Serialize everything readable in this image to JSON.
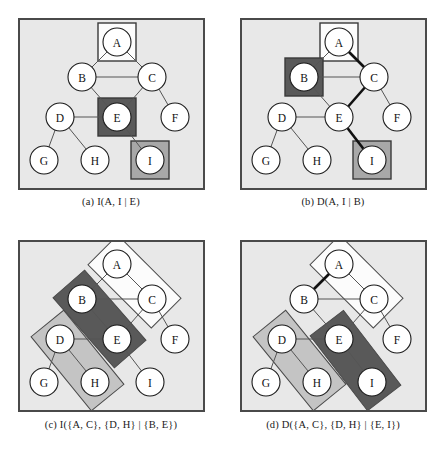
{
  "figure": {
    "kind": "graph-separation-diagram",
    "background": "#ffffff",
    "panel_fill": "#e8e8e8",
    "panel_border": "#4a4a4a",
    "node_fill": "#ffffff",
    "node_stroke": "#1a1a1a",
    "edge_color": "#555555",
    "bold_edge_color": "#111111",
    "shade_dark": "#595959",
    "shade_mid": "#a8a8a8",
    "shade_light": "#c4c4c4",
    "shade_white": "#fcfcfc"
  },
  "graph": {
    "nodes": [
      {
        "id": "A",
        "label": "A",
        "x": 97,
        "y": 22
      },
      {
        "id": "B",
        "label": "B",
        "x": 62,
        "y": 57
      },
      {
        "id": "C",
        "label": "C",
        "x": 132,
        "y": 57
      },
      {
        "id": "D",
        "label": "D",
        "x": 40,
        "y": 97
      },
      {
        "id": "E",
        "label": "E",
        "x": 97,
        "y": 97
      },
      {
        "id": "F",
        "label": "F",
        "x": 155,
        "y": 97
      },
      {
        "id": "G",
        "label": "G",
        "x": 24,
        "y": 140
      },
      {
        "id": "H",
        "label": "H",
        "x": 75,
        "y": 140
      },
      {
        "id": "I",
        "label": "I",
        "x": 130,
        "y": 140
      }
    ],
    "edges": [
      [
        "A",
        "B"
      ],
      [
        "A",
        "C"
      ],
      [
        "B",
        "C"
      ],
      [
        "B",
        "E"
      ],
      [
        "C",
        "E"
      ],
      [
        "C",
        "F"
      ],
      [
        "D",
        "E"
      ],
      [
        "D",
        "G"
      ],
      [
        "D",
        "H"
      ],
      [
        "E",
        "I"
      ]
    ],
    "node_radius": 14
  },
  "panels": [
    {
      "key": "a",
      "caption_prefix": "(a)",
      "caption_expr": "I(A, I | E)",
      "caption_full": "(a) I(A, I | E)",
      "relation": "I",
      "highlight_boxes": [
        {
          "node": "A",
          "shade": "white"
        },
        {
          "node": "E",
          "shade": "dark"
        },
        {
          "node": "I",
          "shade": "mid"
        }
      ],
      "bold_path": [],
      "group_rects": []
    },
    {
      "key": "b",
      "caption_prefix": "(b)",
      "caption_expr": "D(A, I | B)",
      "caption_full": "(b) D(A, I | B)",
      "relation": "D",
      "highlight_boxes": [
        {
          "node": "A",
          "shade": "white"
        },
        {
          "node": "B",
          "shade": "dark"
        },
        {
          "node": "I",
          "shade": "mid"
        }
      ],
      "bold_path": [
        "A",
        "C",
        "E",
        "I"
      ],
      "group_rects": []
    },
    {
      "key": "c",
      "caption_prefix": "(c)",
      "caption_expr": "I({A, C}, {D, H} | {B, E})",
      "caption_full": "(c) I({A, C}, {D, H} | {B, E})",
      "relation": "I",
      "highlight_boxes": [],
      "bold_path": [],
      "group_rects": [
        {
          "nodes": [
            "A",
            "C"
          ],
          "shade": "white"
        },
        {
          "nodes": [
            "B",
            "E"
          ],
          "shade": "dark"
        },
        {
          "nodes": [
            "D",
            "H"
          ],
          "shade": "light"
        }
      ]
    },
    {
      "key": "d",
      "caption_prefix": "(d)",
      "caption_expr": "D({A, C}, {D, H} | {E, I})",
      "caption_full": "(d) D({A, C}, {D, H} | {E, I})",
      "relation": "D",
      "highlight_boxes": [],
      "bold_path": [
        "A",
        "B",
        "D"
      ],
      "group_rects": [
        {
          "nodes": [
            "A",
            "C"
          ],
          "shade": "white"
        },
        {
          "nodes": [
            "D",
            "H"
          ],
          "shade": "light"
        },
        {
          "nodes": [
            "E",
            "I"
          ],
          "shade": "dark"
        }
      ]
    }
  ]
}
